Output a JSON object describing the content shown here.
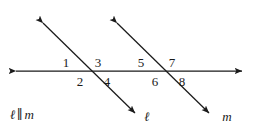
{
  "figure": {
    "type": "geometry-diagram",
    "background_color": "#ffffff",
    "stroke_color": "#1a1a1a"
  },
  "angle_labels": [
    {
      "text": "1",
      "x": 66,
      "y": 62
    },
    {
      "text": "2",
      "x": 80,
      "y": 81
    },
    {
      "text": "3",
      "x": 98,
      "y": 62
    },
    {
      "text": "4",
      "x": 107,
      "y": 81
    },
    {
      "text": "5",
      "x": 141,
      "y": 62
    },
    {
      "text": "6",
      "x": 155,
      "y": 81
    },
    {
      "text": "7",
      "x": 172,
      "y": 62
    },
    {
      "text": "8",
      "x": 182,
      "y": 81
    }
  ],
  "line_labels": [
    {
      "name": "line-label-ell",
      "text": "ℓ",
      "x": 147,
      "y": 116
    },
    {
      "name": "line-label-m",
      "text": "m",
      "x": 227,
      "y": 116
    }
  ],
  "parallel_statement": {
    "line1": "ℓ",
    "symbol": "∥",
    "line2": "m"
  },
  "geometry": {
    "horizontal_line": {
      "x1": 10,
      "y1": 71,
      "x2": 248,
      "y2": 71
    },
    "transversal_ell": {
      "x1": 38,
      "y1": 18,
      "x2": 140,
      "y2": 118
    },
    "transversal_m": {
      "x1": 112,
      "y1": 18,
      "x2": 214,
      "y2": 118
    },
    "intersections": [
      {
        "label": "ell-horizontal",
        "x": 90,
        "y": 71
      },
      {
        "label": "m-horizontal",
        "x": 164,
        "y": 71
      }
    ]
  }
}
